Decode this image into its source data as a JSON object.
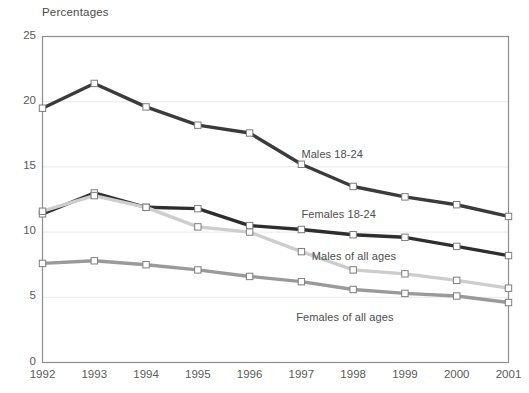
{
  "chart_data": {
    "type": "line",
    "title": "Percentages",
    "xlabel": "",
    "ylabel": "Percentages",
    "grid": true,
    "legend_position": "inline-annotations",
    "x": [
      "1992",
      "1993",
      "1994",
      "1995",
      "1996",
      "1997",
      "1998",
      "1999",
      "2000",
      "2001"
    ],
    "xlim": [
      1992,
      2001
    ],
    "ylim": [
      0,
      25
    ],
    "yticks": [
      "0",
      "5",
      "10",
      "15",
      "20",
      "25"
    ],
    "ytick_values": [
      0,
      5,
      10,
      15,
      20,
      25
    ],
    "series": [
      {
        "name": "Males 18-24",
        "color": "#3b3b3b",
        "marker": "square",
        "values": [
          19.5,
          21.4,
          19.6,
          18.2,
          17.6,
          15.2,
          13.5,
          12.7,
          12.1,
          11.2
        ]
      },
      {
        "name": "Females 18-24",
        "color": "#2e2e2e",
        "marker": "square",
        "values": [
          11.4,
          13.0,
          11.9,
          11.8,
          10.5,
          10.2,
          9.8,
          9.6,
          8.9,
          8.2
        ]
      },
      {
        "name": "Males of all ages",
        "color": "#cdcdcd",
        "marker": "square",
        "values": [
          11.6,
          12.8,
          11.9,
          10.4,
          10.0,
          8.5,
          7.1,
          6.8,
          6.3,
          5.7
        ]
      },
      {
        "name": "Females of all ages",
        "color": "#9a9a9a",
        "marker": "square",
        "values": [
          7.6,
          7.8,
          7.5,
          7.1,
          6.6,
          6.2,
          5.6,
          5.3,
          5.1,
          4.6
        ]
      }
    ],
    "annotations": [
      {
        "text": "Males 18-24",
        "x": 1997.0,
        "y": 15.9
      },
      {
        "text": "Females 18-24",
        "x": 1997.0,
        "y": 11.3
      },
      {
        "text": "Males of all ages",
        "x": 1997.2,
        "y": 8.1
      },
      {
        "text": "Females of all ages",
        "x": 1996.9,
        "y": 3.4
      }
    ]
  },
  "style": {
    "plot_border_color": "#8c8c8c",
    "grid_color": "#e8e8e8",
    "marker_fill": "#ffffff",
    "marker_stroke": "#7d7d7d",
    "text_color": "#5a5a5a",
    "background": "#ffffff"
  }
}
